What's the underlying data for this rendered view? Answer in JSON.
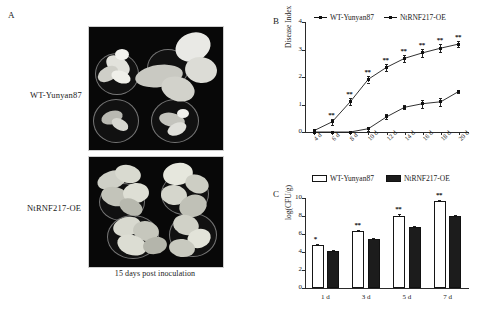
{
  "figure": {
    "panels": [
      "A",
      "B",
      "C"
    ]
  },
  "panelA": {
    "letter": "A",
    "rows": [
      {
        "label": "WT-Yunyan87"
      },
      {
        "label": "NtRNF217-OE"
      }
    ],
    "caption": "15 days post inoculation"
  },
  "panelB": {
    "letter": "B",
    "legend": [
      {
        "label": "WT-Yunyan87",
        "marker": "square-line-marker",
        "color": "#111111"
      },
      {
        "label": "NtRNF217-OE",
        "marker": "square-line-marker",
        "color": "#111111"
      }
    ]
  },
  "panelC": {
    "letter": "C",
    "legend": [
      {
        "label": "WT-Yunyan87",
        "swatch": "open-square-swatch",
        "color": "#ffffff"
      },
      {
        "label": "NtRNF217-OE",
        "swatch": "filled-square-swatch",
        "color": "#1c1c1c"
      }
    ]
  },
  "chart_data": [
    {
      "type": "line",
      "panel": "B",
      "title": "",
      "xlabel": "",
      "ylabel": "Disease Index",
      "categories": [
        "4 d",
        "6 d",
        "8 d",
        "10 d",
        "12 d",
        "14 d",
        "16 d",
        "18 d",
        "20 d"
      ],
      "ylim": [
        0,
        4
      ],
      "yticks": [
        0,
        1,
        2,
        3,
        4
      ],
      "grid": false,
      "legend_position": "top",
      "series": [
        {
          "name": "WT-Yunyan87",
          "values": [
            0.05,
            0.37,
            1.1,
            1.92,
            2.35,
            2.68,
            2.88,
            3.05,
            3.2
          ],
          "errors": [
            0.04,
            0.1,
            0.12,
            0.12,
            0.13,
            0.12,
            0.14,
            0.15,
            0.1
          ],
          "significance": [
            "",
            "**",
            "**",
            "**",
            "**",
            "**",
            "**",
            "**",
            "**"
          ]
        },
        {
          "name": "NtRNF217-OE",
          "values": [
            0.0,
            0.0,
            0.0,
            0.12,
            0.55,
            0.9,
            1.03,
            1.1,
            1.48
          ],
          "errors": [
            0.0,
            0.0,
            0.0,
            0.08,
            0.09,
            0.08,
            0.14,
            0.14,
            0.06
          ],
          "significance": [
            "",
            "",
            "",
            "",
            "",
            "",
            "",
            "",
            ""
          ]
        }
      ]
    },
    {
      "type": "bar",
      "panel": "C",
      "title": "",
      "xlabel": "",
      "ylabel": "log(CFU/g)",
      "categories": [
        "1 d",
        "3 d",
        "5 d",
        "7 d"
      ],
      "ylim": [
        0,
        10
      ],
      "yticks": [
        0,
        2,
        4,
        6,
        8,
        10
      ],
      "grid": false,
      "legend_position": "top",
      "series": [
        {
          "name": "WT-Yunyan87",
          "values": [
            4.75,
            6.28,
            8.05,
            9.68
          ],
          "errors": [
            0.18,
            0.13,
            0.18,
            0.12
          ],
          "significance": [
            "*",
            "**",
            "**",
            "**"
          ]
        },
        {
          "name": "NtRNF217-OE",
          "values": [
            4.15,
            5.5,
            6.82,
            7.98
          ],
          "errors": [
            0.12,
            0.1,
            0.1,
            0.08
          ],
          "significance": [
            "",
            "",
            "",
            ""
          ]
        }
      ]
    }
  ]
}
